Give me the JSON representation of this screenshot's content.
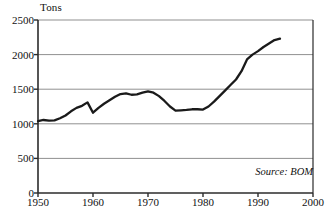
{
  "chart_data": {
    "type": "line",
    "title": "",
    "xlabel": "",
    "ylabel": "Tons",
    "xlim": [
      1950,
      2000
    ],
    "ylim": [
      0,
      2500
    ],
    "grid": true,
    "legend_position": "none",
    "annotation": "Source: BOM",
    "y_ticks": [
      0,
      500,
      1000,
      1500,
      2000,
      2500
    ],
    "y_tick_labels": [
      "0",
      "500",
      "1000",
      "1500",
      "2000",
      "2500"
    ],
    "x_ticks": [
      1950,
      1960,
      1970,
      1980,
      1990,
      2000
    ],
    "x_tick_labels": [
      "1950",
      "1960",
      "1970",
      "1980",
      "1990",
      "2000"
    ],
    "series": [
      {
        "name": "Tons",
        "color": "#1a1a1a",
        "x": [
          1950,
          1951,
          1952,
          1953,
          1954,
          1955,
          1956,
          1957,
          1958,
          1959,
          1960,
          1961,
          1962,
          1963,
          1964,
          1965,
          1966,
          1967,
          1968,
          1969,
          1970,
          1971,
          1972,
          1973,
          1974,
          1975,
          1976,
          1977,
          1978,
          1979,
          1980,
          1981,
          1982,
          1983,
          1984,
          1985,
          1986,
          1987,
          1988,
          1989,
          1990,
          1991,
          1992,
          1993,
          1994
        ],
        "values": [
          1040,
          1055,
          1045,
          1050,
          1080,
          1120,
          1180,
          1230,
          1260,
          1310,
          1160,
          1230,
          1290,
          1340,
          1390,
          1430,
          1440,
          1420,
          1425,
          1450,
          1470,
          1450,
          1400,
          1330,
          1250,
          1190,
          1195,
          1200,
          1210,
          1210,
          1205,
          1250,
          1320,
          1400,
          1480,
          1560,
          1640,
          1760,
          1930,
          2000,
          2050,
          2110,
          2160,
          2210,
          2230
        ]
      }
    ]
  },
  "axis_title": "Tons",
  "source_note": "Source: BOM"
}
